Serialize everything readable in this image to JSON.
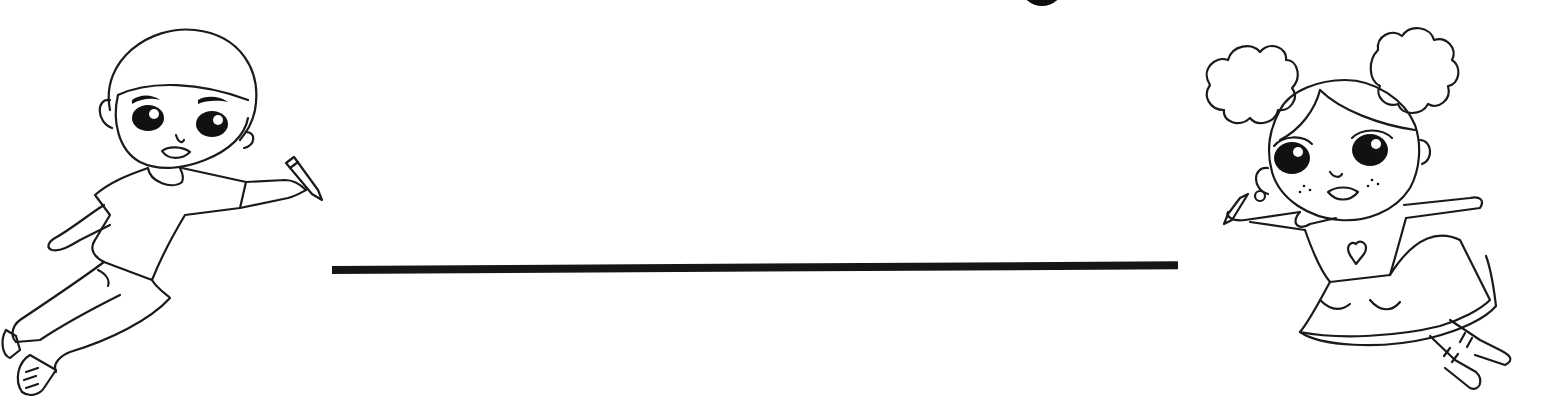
{
  "page": {
    "type": "name-writing worksheet / coloring page",
    "background": "#ffffff",
    "ink_color": "#161616"
  },
  "title": {
    "visible_fragment": "partially cropped dark round glyph at top edge",
    "text": ""
  },
  "writing_line": {
    "label": "Name writing line",
    "color": "#161616"
  },
  "illustrations": [
    {
      "id": "boy",
      "label": "Boy flying with a crayon",
      "position": "left"
    },
    {
      "id": "girl",
      "label": "Girl with puff hair buns flying with a crayon",
      "position": "right"
    }
  ]
}
